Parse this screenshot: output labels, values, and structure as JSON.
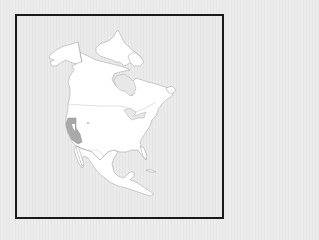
{
  "map": {
    "type": "locator-map",
    "region": "North America",
    "highlighted_region": "California",
    "colors": {
      "land": "#ffffff",
      "highlight": "#a9a9a9",
      "background": "#e8e8e8",
      "frame": "#1a1a1a",
      "outline": "#9a9a9a"
    }
  }
}
